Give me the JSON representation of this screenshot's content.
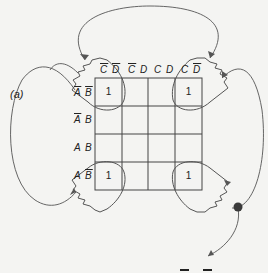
{
  "figure": {
    "panel_label": "(a)",
    "column_headers": [
      {
        "parts": [
          {
            "t": "C",
            "bar": true
          },
          {
            "t": " "
          },
          {
            "t": "D",
            "bar": true
          }
        ],
        "text": "C̄ D̄"
      },
      {
        "parts": [
          {
            "t": "C",
            "bar": true
          },
          {
            "t": " "
          },
          {
            "t": "D",
            "bar": false
          }
        ],
        "text": "C̄ D"
      },
      {
        "parts": [
          {
            "t": "C",
            "bar": false
          },
          {
            "t": " "
          },
          {
            "t": "D",
            "bar": false
          }
        ],
        "text": "C D"
      },
      {
        "parts": [
          {
            "t": "C",
            "bar": false
          },
          {
            "t": " "
          },
          {
            "t": "D",
            "bar": true
          }
        ],
        "text": "C D̄"
      }
    ],
    "row_headers": [
      {
        "parts": [
          {
            "t": "A",
            "bar": true
          },
          {
            "t": " "
          },
          {
            "t": "B",
            "bar": true
          }
        ],
        "text": "Ā B̄"
      },
      {
        "parts": [
          {
            "t": "A",
            "bar": true
          },
          {
            "t": " "
          },
          {
            "t": "B",
            "bar": false
          }
        ],
        "text": "Ā B"
      },
      {
        "parts": [
          {
            "t": "A",
            "bar": false
          },
          {
            "t": " "
          },
          {
            "t": "B",
            "bar": false
          }
        ],
        "text": "A B"
      },
      {
        "parts": [
          {
            "t": "A",
            "bar": false
          },
          {
            "t": " "
          },
          {
            "t": "B",
            "bar": true
          }
        ],
        "text": "A B̄"
      }
    ],
    "cells": [
      [
        "1",
        "",
        "",
        "1"
      ],
      [
        "",
        "",
        "",
        ""
      ],
      [
        "",
        "",
        "",
        ""
      ],
      [
        "1",
        "",
        "",
        "1"
      ]
    ],
    "colors": {
      "line": "#555555",
      "grid": "#444444",
      "dot": "#3a3a3a",
      "background": "#f4f4f2"
    }
  }
}
